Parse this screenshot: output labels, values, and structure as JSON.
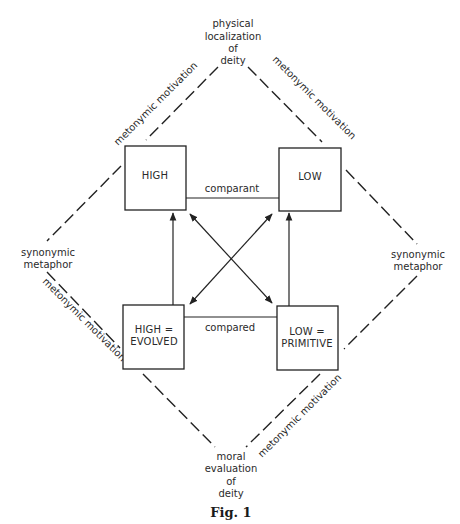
{
  "diagram": {
    "top_label": [
      "physical",
      "localization",
      "of",
      "deity"
    ],
    "bottom_label": [
      "moral",
      "evaluation",
      "of",
      "deity"
    ],
    "left_label": [
      "synonymic",
      "metaphor"
    ],
    "right_label": [
      "synonymic",
      "metaphor"
    ],
    "edge_labels": {
      "top_left": "metonymic motivation",
      "top_right": "metonymic motivation",
      "bottom_left": "metonymic motivation",
      "bottom_right": "metonymic motivation",
      "comparant": "comparant",
      "compared": "compared"
    },
    "boxes": {
      "high": [
        "HIGH"
      ],
      "low": [
        "LOW"
      ],
      "high_evolved": [
        "HIGH =",
        "EVOLVED"
      ],
      "low_primitive": [
        "LOW =",
        "PRIMITIVE"
      ]
    },
    "caption": "Fig. 1"
  }
}
